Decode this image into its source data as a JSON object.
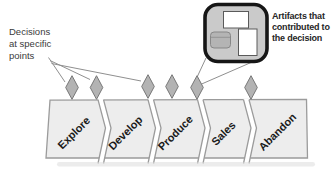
{
  "diagram": {
    "type": "process-lifecycle-decision-diagram",
    "notes": {
      "decisions": {
        "lines": [
          "Decisions",
          "at specific",
          "points"
        ]
      },
      "artifacts": {
        "lines": [
          "Artifacts that",
          "contributed to",
          "the decision"
        ]
      }
    },
    "stages": [
      {
        "label": "Explore"
      },
      {
        "label": "Develop"
      },
      {
        "label": "Produce"
      },
      {
        "label": "Sales"
      },
      {
        "label": "Abandon"
      }
    ],
    "decision_points": {
      "count": 6
    },
    "callout_artifacts": [
      "document",
      "database",
      "document"
    ],
    "colors": {
      "background": "#ffffff",
      "band_fill": "#ededed",
      "band_stroke": "#9b9b9b",
      "diamond_fill": "#b3b3b3",
      "diamond_stroke": "#787878",
      "callout_fill": "#cacaca",
      "callout_stroke": "#161616",
      "artifact_doc_fill": "#ffffff",
      "artifact_db_fill": "#b4b4b4",
      "leader_line": "#8f8f8f",
      "stage_text": "#1a1a1a",
      "note_text": "#3a3a3a",
      "shadow": "#dcdcdc"
    }
  }
}
